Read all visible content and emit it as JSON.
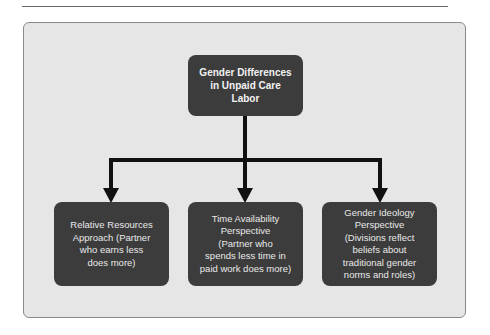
{
  "diagram": {
    "type": "hierarchy",
    "root": {
      "label": "Gender Differences in Unpaid Care Labor",
      "lines": [
        "Gender Differences",
        "in Unpaid Care",
        "Labor"
      ]
    },
    "children": [
      {
        "label": "Relative Resources Approach (Partner who earns less does more)",
        "lines": [
          "Relative Resources",
          "Approach (Partner",
          "who earns less",
          "does more)"
        ]
      },
      {
        "label": "Time Availability Perspective (Partner who spends less time in paid work does more)",
        "lines": [
          "Time Availability",
          "Perspective",
          "(Partner who",
          "spends less time in",
          "paid work does more)"
        ]
      },
      {
        "label": "Gender Ideology Perspective (Divisions reflect beliefs about traditional gender norms and roles)",
        "lines": [
          "Gender Ideology",
          "Perspective",
          "(Divisions reflect",
          "beliefs about",
          "traditional gender",
          "norms and roles)"
        ]
      }
    ],
    "colors": {
      "background": "#ffffff",
      "panel": "#e6e6e6",
      "panel_border": "#8a8a8a",
      "box_fill": "#3c3c3c",
      "box_text": "#e9e9e9",
      "connector": "#111111"
    }
  }
}
